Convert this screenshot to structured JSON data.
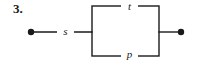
{
  "figure": {
    "problem_number": "3.",
    "width": 203,
    "height": 66,
    "background_color": "#ffffff",
    "stroke_color": "#1a1a1a"
  },
  "labels": {
    "switch_s": "s",
    "switch_t": "t",
    "switch_p": "p"
  },
  "geometry": {
    "left_terminal": {
      "cx": 31,
      "cy": 32,
      "r": 3.2
    },
    "right_terminal": {
      "cx": 181,
      "cy": 32,
      "r": 3.2
    },
    "left_lead": {
      "x1": 31,
      "y1": 32,
      "x2": 92,
      "y2": 32
    },
    "right_lead": {
      "x1": 159,
      "y1": 32,
      "x2": 181,
      "y2": 32
    },
    "rectangle": {
      "x": 92,
      "y": 6,
      "width": 67,
      "height": 50
    },
    "stroke_width": 1.4
  }
}
